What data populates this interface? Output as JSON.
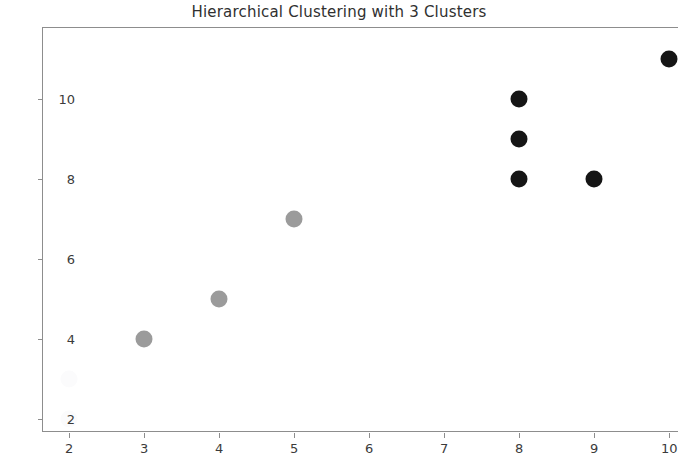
{
  "chart_data": {
    "type": "scatter",
    "title": "Hierarchical Clustering with 3 Clusters",
    "xlabel": "",
    "ylabel": "",
    "xlim": [
      1.65,
      10.13
    ],
    "ylim": [
      1.65,
      11.77
    ],
    "xticks": [
      2,
      3,
      4,
      5,
      6,
      7,
      8,
      9,
      10
    ],
    "yticks": [
      2,
      4,
      6,
      8,
      10
    ],
    "xtick_labels": [
      "2",
      "3",
      "4",
      "5",
      "6",
      "7",
      "8",
      "9",
      "10"
    ],
    "ytick_labels": [
      "2",
      "4",
      "6",
      "8",
      "10"
    ],
    "grid": false,
    "legend": "none",
    "marker_size_px": 17,
    "series": [
      {
        "name": "Cluster 1",
        "color": "#fbfbfc",
        "points": [
          {
            "x": 2,
            "y": 3
          },
          {
            "x": 2,
            "y": 2
          }
        ]
      },
      {
        "name": "Cluster 2",
        "color": "#9b9b9b",
        "points": [
          {
            "x": 3,
            "y": 4
          },
          {
            "x": 4,
            "y": 5
          },
          {
            "x": 5,
            "y": 7
          }
        ]
      },
      {
        "name": "Cluster 3",
        "color": "#151515",
        "points": [
          {
            "x": 8,
            "y": 8
          },
          {
            "x": 8,
            "y": 9
          },
          {
            "x": 8,
            "y": 10
          },
          {
            "x": 9,
            "y": 8
          },
          {
            "x": 10,
            "y": 11
          }
        ]
      }
    ]
  },
  "axes": {
    "spine_color": "#8d8d8d",
    "tick_label_color": "#3b3b3b",
    "title_color": "#303030",
    "background": "#ffffff"
  }
}
